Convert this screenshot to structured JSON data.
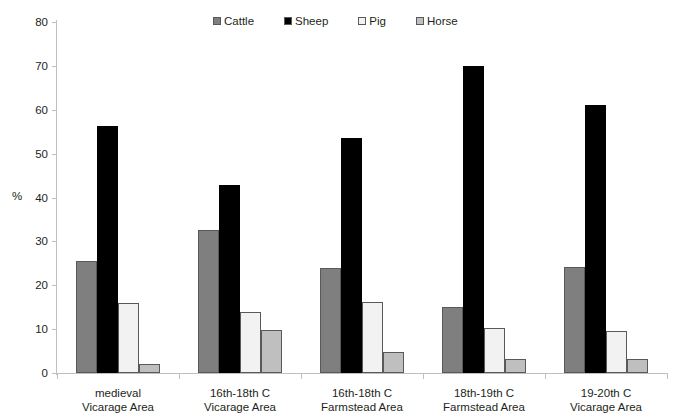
{
  "chart_data": {
    "type": "bar",
    "title": "",
    "xlabel": "",
    "ylabel": "%",
    "ylim": [
      0,
      80
    ],
    "ytick_step": 10,
    "yticks": [
      80,
      70,
      60,
      50,
      40,
      30,
      20,
      10,
      0
    ],
    "grid": false,
    "legend_position": "top-center",
    "categories": [
      "medieval\nVicarage Area",
      "16th-18th C\nVicarage Area",
      "16th-18th C\nFarmstead Area",
      "18th-19th C\nFarmstead Area",
      "19-20th C\nVicarage Area"
    ],
    "category_lines": [
      [
        "medieval",
        "Vicarage Area"
      ],
      [
        "16th-18th C",
        "Vicarage Area"
      ],
      [
        "16th-18th C",
        "Farmstead Area"
      ],
      [
        "18th-19th C",
        "Farmstead Area"
      ],
      [
        "19-20th C",
        "Vicarage Area"
      ]
    ],
    "series": [
      {
        "name": "Cattle",
        "color": "#7f7f7f",
        "values": [
          25.5,
          32.6,
          24.0,
          15.1,
          24.2
        ]
      },
      {
        "name": "Sheep",
        "color": "#000000",
        "values": [
          56.3,
          42.9,
          53.6,
          70.0,
          61.2
        ]
      },
      {
        "name": "Pig",
        "color": "#f2f2f2",
        "values": [
          15.9,
          14.0,
          16.2,
          10.3,
          9.5
        ]
      },
      {
        "name": "Horse",
        "color": "#bfbfbf",
        "values": [
          2.0,
          9.9,
          4.8,
          3.2,
          3.2
        ]
      }
    ]
  },
  "legend": {
    "items": [
      {
        "label": "Cattle",
        "color": "#7f7f7f",
        "icon": "legend-swatch-icon"
      },
      {
        "label": "Sheep",
        "color": "#000000",
        "icon": "legend-swatch-icon"
      },
      {
        "label": "Pig",
        "color": "#f2f2f2",
        "icon": "legend-swatch-icon"
      },
      {
        "label": "Horse",
        "color": "#bfbfbf",
        "icon": "legend-swatch-icon"
      }
    ]
  },
  "axes": {
    "y_axis_label": "%",
    "y_tick_labels": [
      "80",
      "70",
      "60",
      "50",
      "40",
      "30",
      "20",
      "10",
      "0"
    ]
  },
  "colors": {
    "axis": "#bfbfbf",
    "bar_border": "#595959",
    "text": "#231f20",
    "background": "#ffffff"
  }
}
